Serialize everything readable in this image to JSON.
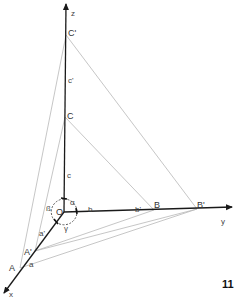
{
  "diagram": {
    "axes": {
      "x": {
        "label": "x"
      },
      "y": {
        "label": "y"
      },
      "z": {
        "label": "z"
      }
    },
    "origin": {
      "label": "O"
    },
    "points": {
      "A": "A",
      "A_prime": "A'",
      "B": "B",
      "B_prime": "B'",
      "C": "C",
      "C_prime": "C'"
    },
    "segments": {
      "a": "a",
      "a_prime": "a'",
      "b": "b",
      "b_prime": "b'",
      "c": "c",
      "c_prime": "c'"
    },
    "angles": {
      "alpha": "α",
      "beta": "ß",
      "gamma": "γ"
    },
    "colors": {
      "axis": "#1a1a1a",
      "construction_line": "#b5b5b5"
    }
  },
  "page_number": "11"
}
